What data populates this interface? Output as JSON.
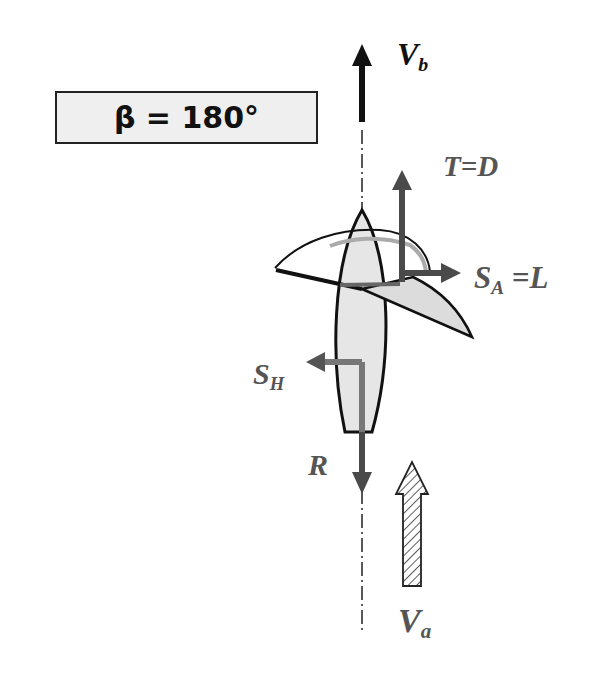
{
  "figure": {
    "angle_box": {
      "text": "β = 180°"
    },
    "labels": {
      "boat_velocity": {
        "main": "V",
        "sub": "b"
      },
      "thrust_drag": {
        "text": "T=D"
      },
      "side_force_lift": {
        "main": "S",
        "sub": "A",
        "rest": " =L"
      },
      "hull_side_force": {
        "main": "S",
        "sub": "H"
      },
      "resistance": {
        "text": "R"
      },
      "apparent_wind": {
        "main": "V",
        "sub": "a"
      }
    },
    "colors": {
      "ink": "#111111",
      "force_arrow": "#4a4a4a",
      "hull_fill": "#e6e6e6",
      "sail_fill": "#dcdcdc",
      "box_fill": "#efefef"
    }
  }
}
